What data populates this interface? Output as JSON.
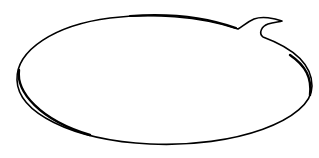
{
  "bubble": {
    "shape": "speech-bubble",
    "text": "",
    "stroke_color": "#000000",
    "fill_color": "#ffffff",
    "background_color": "#ffffff"
  }
}
